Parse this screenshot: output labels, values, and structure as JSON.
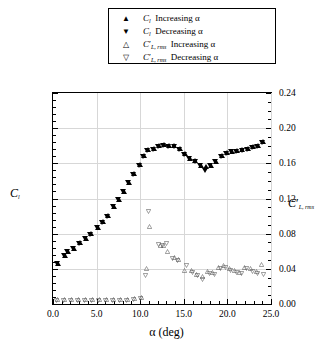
{
  "legend": {
    "items": [
      {
        "symbol": "▲",
        "marker": "filled-up-triangle",
        "text": "Increasing α",
        "var": "Cl"
      },
      {
        "symbol": "▼",
        "marker": "filled-down-triangle",
        "text": "Decreasing α",
        "var": "Cl"
      },
      {
        "symbol": "△",
        "marker": "open-up-triangle",
        "text": "Increasing α",
        "var": "ClrmsPrime"
      },
      {
        "symbol": "▽",
        "marker": "open-down-triangle",
        "text": "Decreasing α",
        "var": "ClrmsPrime"
      }
    ],
    "var_labels": {
      "cl_base": "C",
      "cl_sub": "l",
      "rms_base": "C",
      "rms_prime": "′",
      "rms_sub": "L, rms"
    }
  },
  "axes": {
    "x": {
      "label": "α (deg)",
      "min": 0.0,
      "max": 25.0,
      "ticks": [
        "0.0",
        "5.0",
        "10.0",
        "15.0",
        "20.0",
        "25.0"
      ],
      "tick_values": [
        0,
        5,
        10,
        15,
        20,
        25
      ],
      "minor_per_interval": 5
    },
    "y_left": {
      "label_base": "C",
      "label_sub": "l",
      "min": 0.0,
      "max": 1.5,
      "ticks": [
        "0.00",
        "0.25",
        "0.50",
        "0.75",
        "1.00",
        "1.25",
        "1.50"
      ],
      "tick_values": [
        0,
        0.25,
        0.5,
        0.75,
        1.0,
        1.25,
        1.5
      ],
      "minor_per_interval": 5
    },
    "y_right": {
      "label_base": "C",
      "label_prime": "′",
      "label_sub": "L, rms",
      "min": 0.0,
      "max": 0.24,
      "ticks": [
        "0.00",
        "0.04",
        "0.08",
        "0.12",
        "0.16",
        "0.20",
        "0.24"
      ],
      "tick_values": [
        0,
        0.04,
        0.08,
        0.12,
        0.16,
        0.2,
        0.24
      ],
      "minor_per_interval": 4
    }
  },
  "chart_data": {
    "type": "scatter",
    "title": "",
    "xlabel": "α (deg)",
    "ylabel": "C_l",
    "ylabel_right": "C'_L,rms",
    "xlim": [
      0.0,
      25.0
    ],
    "ylim": [
      0.0,
      1.5
    ],
    "ylim_right": [
      0.0,
      0.24
    ],
    "grid": true,
    "legend_position": "above-plot",
    "series": [
      {
        "name": "C_l Increasing α",
        "marker": "filled-up-triangle",
        "axis": "left",
        "points": [
          [
            0.55,
            0.285
          ],
          [
            1.35,
            0.345
          ],
          [
            1.75,
            0.375
          ],
          [
            2.45,
            0.395
          ],
          [
            3.15,
            0.435
          ],
          [
            3.75,
            0.465
          ],
          [
            4.35,
            0.5
          ],
          [
            5.15,
            0.545
          ],
          [
            5.75,
            0.585
          ],
          [
            6.35,
            0.625
          ],
          [
            7.05,
            0.695
          ],
          [
            7.55,
            0.745
          ],
          [
            8.15,
            0.8
          ],
          [
            8.75,
            0.865
          ],
          [
            9.35,
            0.925
          ],
          [
            9.95,
            0.99
          ],
          [
            10.45,
            1.055
          ],
          [
            10.95,
            1.095
          ],
          [
            11.55,
            1.105
          ],
          [
            12.15,
            1.125
          ],
          [
            12.75,
            1.13
          ],
          [
            13.35,
            1.125
          ],
          [
            13.95,
            1.125
          ],
          [
            14.55,
            1.105
          ],
          [
            15.15,
            1.065
          ],
          [
            15.75,
            1.035
          ],
          [
            16.35,
            1.02
          ],
          [
            16.95,
            0.985
          ],
          [
            17.55,
            0.975
          ],
          [
            18.15,
            0.985
          ],
          [
            18.75,
            1.015
          ],
          [
            19.35,
            1.055
          ],
          [
            19.95,
            1.075
          ],
          [
            20.55,
            1.085
          ],
          [
            21.15,
            1.09
          ],
          [
            21.75,
            1.095
          ],
          [
            22.35,
            1.105
          ],
          [
            22.95,
            1.115
          ],
          [
            23.55,
            1.125
          ],
          [
            24.05,
            1.155
          ]
        ]
      },
      {
        "name": "C_l Decreasing α",
        "marker": "filled-down-triangle",
        "axis": "left",
        "points": [
          [
            0.45,
            0.285
          ],
          [
            1.25,
            0.345
          ],
          [
            1.65,
            0.37
          ],
          [
            2.35,
            0.395
          ],
          [
            3.05,
            0.43
          ],
          [
            3.65,
            0.465
          ],
          [
            4.25,
            0.495
          ],
          [
            5.05,
            0.545
          ],
          [
            5.65,
            0.58
          ],
          [
            6.25,
            0.62
          ],
          [
            6.95,
            0.69
          ],
          [
            7.45,
            0.74
          ],
          [
            8.05,
            0.795
          ],
          [
            8.65,
            0.86
          ],
          [
            9.25,
            0.92
          ],
          [
            9.85,
            0.985
          ],
          [
            10.35,
            1.05
          ],
          [
            10.85,
            1.09
          ],
          [
            11.45,
            1.1
          ],
          [
            12.05,
            1.12
          ],
          [
            12.65,
            1.125
          ],
          [
            13.25,
            1.12
          ],
          [
            13.85,
            1.12
          ],
          [
            14.45,
            1.1
          ],
          [
            15.05,
            1.06
          ],
          [
            15.65,
            1.03
          ],
          [
            16.25,
            1.015
          ],
          [
            16.85,
            0.98
          ],
          [
            17.45,
            0.945
          ],
          [
            18.05,
            0.98
          ],
          [
            18.65,
            1.01
          ],
          [
            19.25,
            1.05
          ],
          [
            19.85,
            1.07
          ],
          [
            20.45,
            1.08
          ],
          [
            21.05,
            1.085
          ],
          [
            21.65,
            1.09
          ],
          [
            22.25,
            1.1
          ],
          [
            22.85,
            1.11
          ],
          [
            23.45,
            1.12
          ],
          [
            23.95,
            1.15
          ]
        ]
      },
      {
        "name": "C'_L,rms Increasing α",
        "marker": "open-up-triangle",
        "axis": "right",
        "points": [
          [
            0.5,
            0.005
          ],
          [
            1.3,
            0.005
          ],
          [
            2.1,
            0.005
          ],
          [
            2.9,
            0.005
          ],
          [
            3.7,
            0.005
          ],
          [
            4.5,
            0.005
          ],
          [
            5.3,
            0.005
          ],
          [
            6.1,
            0.005
          ],
          [
            6.9,
            0.005
          ],
          [
            7.7,
            0.005
          ],
          [
            8.5,
            0.005
          ],
          [
            9.3,
            0.006
          ],
          [
            10.1,
            0.007
          ],
          [
            10.7,
            0.04
          ],
          [
            11.1,
            0.088
          ],
          [
            12.3,
            0.066
          ],
          [
            12.7,
            0.066
          ],
          [
            13.1,
            0.06
          ],
          [
            13.9,
            0.053
          ],
          [
            14.4,
            0.051
          ],
          [
            15.1,
            0.038
          ],
          [
            15.9,
            0.038
          ],
          [
            16.5,
            0.034
          ],
          [
            17.1,
            0.031
          ],
          [
            17.7,
            0.037
          ],
          [
            18.3,
            0.036
          ],
          [
            19.0,
            0.042
          ],
          [
            19.6,
            0.044
          ],
          [
            20.2,
            0.04
          ],
          [
            20.8,
            0.038
          ],
          [
            21.4,
            0.036
          ],
          [
            22.0,
            0.042
          ],
          [
            22.7,
            0.04
          ],
          [
            23.3,
            0.037
          ],
          [
            23.9,
            0.045
          ]
        ]
      },
      {
        "name": "C'_L,rms Decreasing α",
        "marker": "open-down-triangle",
        "axis": "right",
        "points": [
          [
            0.4,
            0.004
          ],
          [
            1.2,
            0.004
          ],
          [
            2.0,
            0.004
          ],
          [
            2.8,
            0.004
          ],
          [
            3.6,
            0.004
          ],
          [
            4.4,
            0.004
          ],
          [
            5.2,
            0.004
          ],
          [
            6.0,
            0.004
          ],
          [
            6.8,
            0.004
          ],
          [
            7.6,
            0.004
          ],
          [
            8.4,
            0.004
          ],
          [
            9.2,
            0.005
          ],
          [
            10.0,
            0.006
          ],
          [
            10.6,
            0.032
          ],
          [
            11.0,
            0.105
          ],
          [
            12.1,
            0.068
          ],
          [
            12.5,
            0.067
          ],
          [
            13.0,
            0.069
          ],
          [
            13.7,
            0.052
          ],
          [
            14.3,
            0.05
          ],
          [
            15.3,
            0.044
          ],
          [
            16.0,
            0.036
          ],
          [
            16.6,
            0.032
          ],
          [
            17.2,
            0.028
          ],
          [
            17.9,
            0.035
          ],
          [
            18.5,
            0.034
          ],
          [
            19.2,
            0.04
          ],
          [
            19.8,
            0.041
          ],
          [
            20.4,
            0.038
          ],
          [
            21.0,
            0.036
          ],
          [
            21.6,
            0.035
          ],
          [
            22.2,
            0.04
          ],
          [
            22.9,
            0.037
          ],
          [
            23.5,
            0.035
          ],
          [
            24.1,
            0.034
          ]
        ]
      }
    ]
  }
}
